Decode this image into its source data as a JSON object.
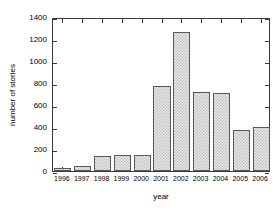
{
  "chart_data": {
    "type": "bar",
    "title": "",
    "xlabel": "year",
    "ylabel": "number of stories",
    "categories": [
      "1996",
      "1997",
      "1998",
      "1999",
      "2000",
      "2001",
      "2002",
      "2003",
      "2004",
      "2005",
      "2006"
    ],
    "values": [
      25,
      45,
      140,
      145,
      150,
      770,
      1260,
      720,
      710,
      375,
      400
    ],
    "ylim": [
      0,
      1400
    ],
    "yticks": [
      0,
      200,
      400,
      600,
      800,
      1000,
      1200,
      1400
    ],
    "ytick_labels": [
      "0",
      "200",
      "400",
      "600",
      "800",
      "1000",
      "1200",
      "1400"
    ],
    "grid": false,
    "legend": null,
    "bar_fill_color": "#e8e8e8",
    "bar_pattern_color": "#bdbdbd",
    "bar_edge_color": "#595959",
    "axis_color": "#3a3a3a",
    "background_color": "#ffffff"
  }
}
